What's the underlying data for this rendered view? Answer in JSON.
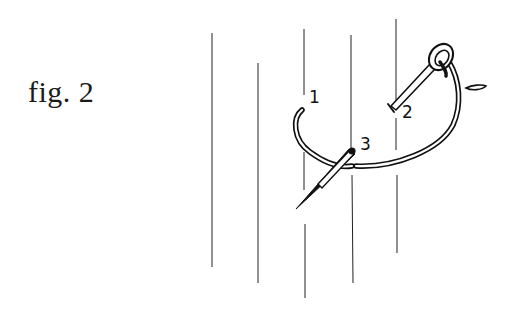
{
  "figure": {
    "caption": "fig. 2",
    "type": "embroidery stitch instruction diagram"
  },
  "labels": {
    "point_1": "1",
    "point_2": "2",
    "point_3": "3"
  },
  "colors": {
    "background": "#ffffff",
    "ink": "#111111"
  },
  "elements": {
    "fabric_lines_count": 5,
    "needle": "needle-icon",
    "thread": "thread-loop"
  }
}
